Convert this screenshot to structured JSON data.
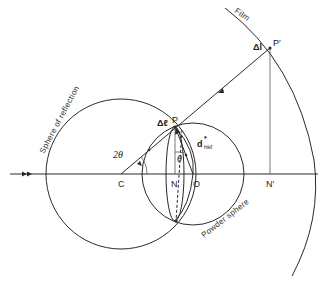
{
  "diagram": {
    "type": "geometric construction (Debye–Scherrer / Ewald sphere)",
    "labels": {
      "film": "Film",
      "sphere_of_reflection": "Sphere of reflection",
      "powder_sphere": "Powder sphere",
      "point_P": "P",
      "point_P_prime": "P′",
      "point_C": "C",
      "point_N": "N",
      "point_O": "O",
      "point_N_prime": "N′",
      "angle_2theta": "2θ",
      "angle_theta": "θ",
      "delta_l": "Δl",
      "delta_l_script": "Δℓ",
      "d_hkl_main": "d",
      "d_hkl_star": "*",
      "d_hkl_sub": "hkℓ"
    },
    "points": {
      "C": [
        121,
        174
      ],
      "P": [
        175,
        127
      ],
      "N": [
        175,
        174
      ],
      "O": [
        193,
        174
      ],
      "P_prime": [
        270,
        48
      ],
      "N_prime": [
        270,
        174
      ]
    },
    "circles": {
      "sphere_of_reflection": {
        "cx": 121,
        "cy": 174,
        "r": 75
      },
      "powder_sphere": {
        "cx": 193,
        "cy": 174,
        "r": 51
      }
    },
    "incident_beam_arrow": "double-arrowhead"
  }
}
